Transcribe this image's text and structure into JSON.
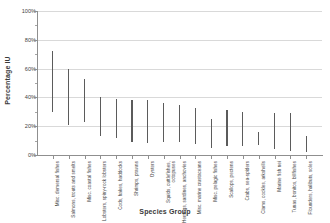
{
  "chart_data": {
    "type": "bar",
    "title": "",
    "xlabel": "Species Group",
    "ylabel": "Percentage IU",
    "ylim": [
      0,
      100
    ],
    "yunit": "%",
    "grid": true,
    "legend": null,
    "ytick_labels": [
      "100%",
      "80%",
      "60%",
      "40%",
      "20%",
      "0%"
    ],
    "ytick_values": [
      100,
      80,
      60,
      40,
      20,
      0
    ],
    "yminor_values": [
      90,
      70,
      50,
      30,
      10
    ],
    "categories": [
      "Misc. demersal fishes",
      "Salmons, trouts and smelts",
      "Misc. coastal fishes",
      "Lobsters, spiny-rock lobsters",
      "Cods, hakes, haddocks",
      "Shrimps, prawns",
      "Oysters",
      "Squids, cuttlefishes, octopuses",
      "Herrings, sardines, anchovies",
      "Misc. marine crustaceans",
      "Misc. pelagic fishes",
      "Scallops, pectens",
      "Crabs, sea-spiders",
      "Clams, cockles, arkshells",
      "Marine fish nei",
      "Tunas, bonitos, billfishes",
      "Flounders, halibuts, soles"
    ],
    "series": [
      {
        "name": "Percentage IU range",
        "low": [
          30,
          21,
          23,
          13,
          12,
          9,
          8,
          9,
          9,
          8,
          5,
          6,
          6,
          7,
          4,
          3,
          2
        ],
        "high": [
          72,
          60,
          53,
          40,
          39,
          38,
          38,
          36,
          35,
          33,
          25,
          31,
          30,
          16,
          29,
          29,
          13
        ]
      }
    ]
  }
}
